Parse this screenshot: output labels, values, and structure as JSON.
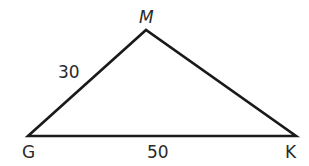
{
  "diagram": {
    "type": "triangle",
    "vertices": [
      {
        "name": "G",
        "x": 28,
        "y": 136
      },
      {
        "name": "M",
        "x": 146,
        "y": 30
      },
      {
        "name": "K",
        "x": 296,
        "y": 136
      }
    ],
    "labels": {
      "vertex_m": "M",
      "vertex_g": "G",
      "vertex_k": "K",
      "side_gm": "30",
      "side_gk": "50"
    },
    "stroke_color": "#1a1a1a"
  }
}
